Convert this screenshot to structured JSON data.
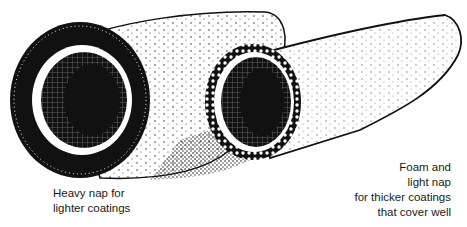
{
  "illustration": {
    "subject": "Two paint roller covers",
    "items": [
      {
        "name": "heavy-nap-roller",
        "caption_lines": [
          "Heavy nap for",
          "lighter coatings"
        ]
      },
      {
        "name": "foam-light-nap-roller",
        "caption_lines": [
          "Foam and",
          "light nap",
          "for thicker coatings",
          "that cover well"
        ]
      }
    ],
    "colors": {
      "ink": "#111111",
      "paper": "#ffffff"
    }
  }
}
